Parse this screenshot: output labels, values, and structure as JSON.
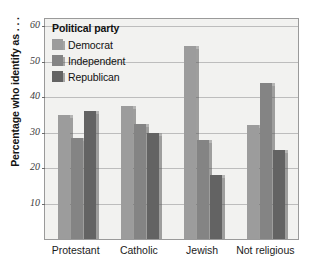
{
  "chart_data": {
    "type": "bar",
    "title": "",
    "xlabel": "",
    "ylabel": "Percentage who identify as . . .",
    "ylim": [
      0,
      62
    ],
    "yticks": [
      10,
      20,
      30,
      40,
      50,
      60
    ],
    "grid": true,
    "legend_position": "top-left",
    "legend_title": "Political party",
    "categories": [
      "Protestant",
      "Catholic",
      "Jewish",
      "Not religious"
    ],
    "series": [
      {
        "name": "Democrat",
        "color": "#9c9c9c",
        "values": [
          35,
          37.5,
          54.5,
          32
        ]
      },
      {
        "name": "Independent",
        "color": "#848484",
        "values": [
          28.5,
          32.5,
          28,
          44
        ]
      },
      {
        "name": "Republican",
        "color": "#636363",
        "values": [
          36,
          30,
          18,
          25
        ]
      }
    ]
  }
}
